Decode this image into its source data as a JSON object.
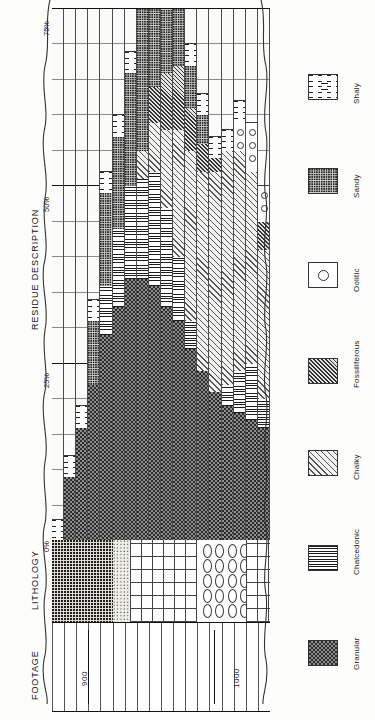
{
  "axes": {
    "residue_title": "RESIDUE DESCRIPTION",
    "lithology_title": "LITHOLOGY",
    "footage_title": "FOOTAGE",
    "percent_ticks": [
      "75%",
      "50%",
      "25%",
      "0%"
    ],
    "footage_marks": [
      "900",
      "1000"
    ]
  },
  "legend": {
    "items": [
      {
        "label": "Granular",
        "pattern": "granular"
      },
      {
        "label": "Chalcedonic",
        "pattern": "chalcedonic"
      },
      {
        "label": "Chalky",
        "pattern": "chalky"
      },
      {
        "label": "Fossiliferous",
        "pattern": "fossil"
      },
      {
        "label": "Oolitic",
        "pattern": "oolitic"
      },
      {
        "label": "Sandy",
        "pattern": "sandy"
      },
      {
        "label": "Shaly",
        "pattern": "shaly"
      }
    ]
  },
  "chart_data": {
    "type": "bar",
    "title": "RESIDUE DESCRIPTION",
    "xlabel": "Percent of residue",
    "ylabel": "FOOTAGE",
    "xlim": [
      0,
      75
    ],
    "grid": true,
    "orientation": "horizontal-stacked-by-depth",
    "percent_ticks": [
      0,
      25,
      50,
      75
    ],
    "depth_range": [
      880,
      1020
    ],
    "components": [
      "Granular",
      "Chalcedonic",
      "Chalky",
      "Fossiliferous",
      "Oolitic",
      "Sandy",
      "Shaly"
    ],
    "rows": [
      {
        "depth": 884,
        "granular": 0,
        "chalcedonic": 0,
        "chalky": 0,
        "fossil": 0,
        "oolitic": 0,
        "sandy": 0,
        "shaly": 3
      },
      {
        "depth": 889,
        "granular": 9,
        "chalcedonic": 0,
        "chalky": 0,
        "fossil": 0,
        "oolitic": 0,
        "sandy": 0,
        "shaly": 3
      },
      {
        "depth": 894,
        "granular": 16,
        "chalcedonic": 0,
        "chalky": 0,
        "fossil": 0,
        "oolitic": 0,
        "sandy": 0,
        "shaly": 3
      },
      {
        "depth": 899,
        "granular": 22,
        "chalcedonic": 0,
        "chalky": 0,
        "fossil": 0,
        "oolitic": 0,
        "sandy": 9,
        "shaly": 3
      },
      {
        "depth": 904,
        "granular": 29,
        "chalcedonic": 7,
        "chalky": 0,
        "fossil": 0,
        "oolitic": 0,
        "sandy": 13,
        "shaly": 3
      },
      {
        "depth": 909,
        "granular": 33,
        "chalcedonic": 11,
        "chalky": 0,
        "fossil": 0,
        "oolitic": 0,
        "sandy": 13,
        "shaly": 3
      },
      {
        "depth": 914,
        "granular": 37,
        "chalcedonic": 13,
        "chalky": 0,
        "fossil": 0,
        "oolitic": 0,
        "sandy": 16,
        "shaly": 3
      },
      {
        "depth": 919,
        "granular": 37,
        "chalcedonic": 14,
        "chalky": 4,
        "fossil": 0,
        "oolitic": 0,
        "sandy": 20,
        "shaly": 3
      },
      {
        "depth": 924,
        "granular": 36,
        "chalcedonic": 16,
        "chalky": 7,
        "fossil": 5,
        "oolitic": 0,
        "sandy": 18,
        "shaly": 3
      },
      {
        "depth": 929,
        "granular": 33,
        "chalcedonic": 14,
        "chalky": 11,
        "fossil": 8,
        "oolitic": 0,
        "sandy": 14,
        "shaly": 3
      },
      {
        "depth": 934,
        "granular": 31,
        "chalcedonic": 9,
        "chalky": 18,
        "fossil": 9,
        "oolitic": 0,
        "sandy": 9,
        "shaly": 3
      },
      {
        "depth": 939,
        "granular": 27,
        "chalcedonic": 4,
        "chalky": 24,
        "fossil": 6,
        "oolitic": 0,
        "sandy": 6,
        "shaly": 3
      },
      {
        "depth": 944,
        "granular": 24,
        "chalcedonic": 0,
        "chalky": 28,
        "fossil": 4,
        "oolitic": 0,
        "sandy": 4,
        "shaly": 3
      },
      {
        "depth": 949,
        "granular": 21,
        "chalcedonic": 0,
        "chalky": 31,
        "fossil": 2,
        "oolitic": 0,
        "sandy": 0,
        "shaly": 3
      },
      {
        "depth": 954,
        "granular": 19,
        "chalcedonic": 3,
        "chalky": 33,
        "fossil": 0,
        "oolitic": 0,
        "sandy": 0,
        "shaly": 3
      },
      {
        "depth": 959,
        "granular": 18,
        "chalcedonic": 6,
        "chalky": 31,
        "fossil": 0,
        "oolitic": 4,
        "sandy": 0,
        "shaly": 3
      },
      {
        "depth": 964,
        "granular": 17,
        "chalcedonic": 8,
        "chalky": 27,
        "fossil": 0,
        "oolitic": 7,
        "sandy": 0,
        "shaly": 0
      },
      {
        "depth": 969,
        "granular": 16,
        "chalcedonic": 4,
        "chalky": 21,
        "fossil": 4,
        "oolitic": 5,
        "sandy": 0,
        "shaly": 0
      }
    ]
  },
  "lithology_column": {
    "label": "LITHOLOGY",
    "units": [
      "sandstone",
      "siltstone",
      "limestone",
      "oolite"
    ]
  }
}
